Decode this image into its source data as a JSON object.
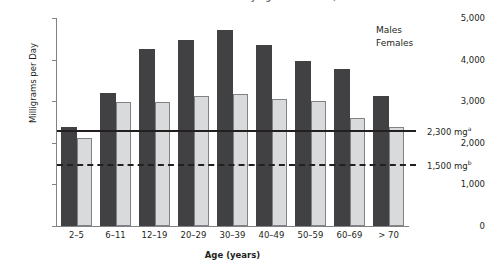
{
  "chart_data": {
    "type": "bar",
    "title": "Estimated Mean Usual Intake of Sodium by Age and Gender,\nNHANES 2005-2006",
    "xlabel": "Age (years)",
    "ylabel": "Milligrams per Day",
    "ylim": [
      0,
      5000
    ],
    "ytick_labels": [
      "5,000",
      "4,000",
      "3,000",
      "2,000",
      "1,000",
      "0"
    ],
    "ytick_values": [
      5000,
      4000,
      3000,
      2000,
      1000,
      0
    ],
    "categories": [
      "2–5",
      "6–11",
      "12–19",
      "20–29",
      "30–39",
      "40–49",
      "50–59",
      "60–69",
      "> 70"
    ],
    "series": [
      {
        "name": "Males",
        "color": "#414042",
        "values": [
          2380,
          3200,
          4250,
          4470,
          4720,
          4350,
          3960,
          3780,
          3130
        ]
      },
      {
        "name": "Females",
        "color": "#d9dadb",
        "values": [
          2120,
          2980,
          2980,
          3120,
          3170,
          3050,
          3000,
          2600,
          2370
        ]
      }
    ],
    "reference_lines": [
      {
        "name": "upper-limit",
        "value": 2300,
        "label": "2,300 mg",
        "superscript": "a",
        "style": "solid"
      },
      {
        "name": "lower-limit",
        "value": 1500,
        "label": "1,500 mg",
        "superscript": "b",
        "style": "dashed"
      }
    ],
    "legend": {
      "position": "top-right",
      "entries": [
        "Males",
        "Females"
      ]
    },
    "grid": false
  }
}
